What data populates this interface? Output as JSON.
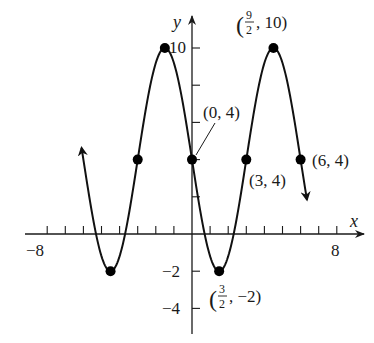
{
  "chart_data": {
    "type": "line",
    "title": "",
    "xlabel": "x",
    "ylabel": "y",
    "xlim": [
      -8,
      8
    ],
    "ylim": [
      -4,
      10
    ],
    "grid": false,
    "function": "y = 4 - 6 sin(pi x / 3)",
    "curve": {
      "amplitude": 6,
      "midline": 4,
      "period": 6,
      "x_start": -6.1,
      "x_end": 6.35,
      "arrows_both_ends": true
    },
    "x_ticks": [
      -8,
      -7,
      -6,
      -5,
      -4,
      -3,
      -2,
      -1,
      1,
      2,
      3,
      4,
      5,
      6,
      7,
      8
    ],
    "x_tick_labels": [
      {
        "value": -8,
        "text": "−8"
      },
      {
        "value": 8,
        "text": "8"
      }
    ],
    "y_ticks": [
      -4,
      -2,
      2,
      4,
      6,
      8,
      10
    ],
    "y_tick_labels": [
      {
        "value": 10,
        "text": "10"
      },
      {
        "value": -2,
        "text": "−2"
      },
      {
        "value": -4,
        "text": "−4"
      }
    ],
    "points": [
      {
        "x": -4.5,
        "y": -2
      },
      {
        "x": -3,
        "y": 4
      },
      {
        "x": -1.5,
        "y": 10
      },
      {
        "x": 0,
        "y": 4
      },
      {
        "x": 1.5,
        "y": -2
      },
      {
        "x": 3,
        "y": 4
      },
      {
        "x": 4.5,
        "y": 10
      },
      {
        "x": 6,
        "y": 4
      }
    ],
    "annotations": [
      {
        "text": "(0, 4)",
        "x": 0,
        "y": 4,
        "leader_line": true
      },
      {
        "text": "(3, 4)",
        "x": 3,
        "y": 4
      },
      {
        "text": "(6, 4)",
        "x": 6,
        "y": 4
      },
      {
        "text": "(9/2, 10)",
        "x": 4.5,
        "y": 10,
        "frac_num": "9",
        "frac_den": "2",
        "rest": ", 10)"
      },
      {
        "text": "(3/2, −2)",
        "x": 1.5,
        "y": -2,
        "frac_num": "3",
        "frac_den": "2",
        "rest": ", −2)"
      }
    ]
  },
  "labels": {
    "x_axis": "x",
    "y_axis": "y",
    "neg8": "−8",
    "pos8": "8",
    "y10": "10",
    "yneg2": "−2",
    "yneg4": "−4",
    "ann_0_4": "(0, 4)",
    "ann_3_4": "(3, 4)",
    "ann_6_4": "(6, 4)",
    "open_paren": "(",
    "ann_92_num": "9",
    "ann_92_den": "2",
    "ann_92_rest": ", 10)",
    "ann_32_num": "3",
    "ann_32_den": "2",
    "ann_32_rest": ", −2)"
  }
}
